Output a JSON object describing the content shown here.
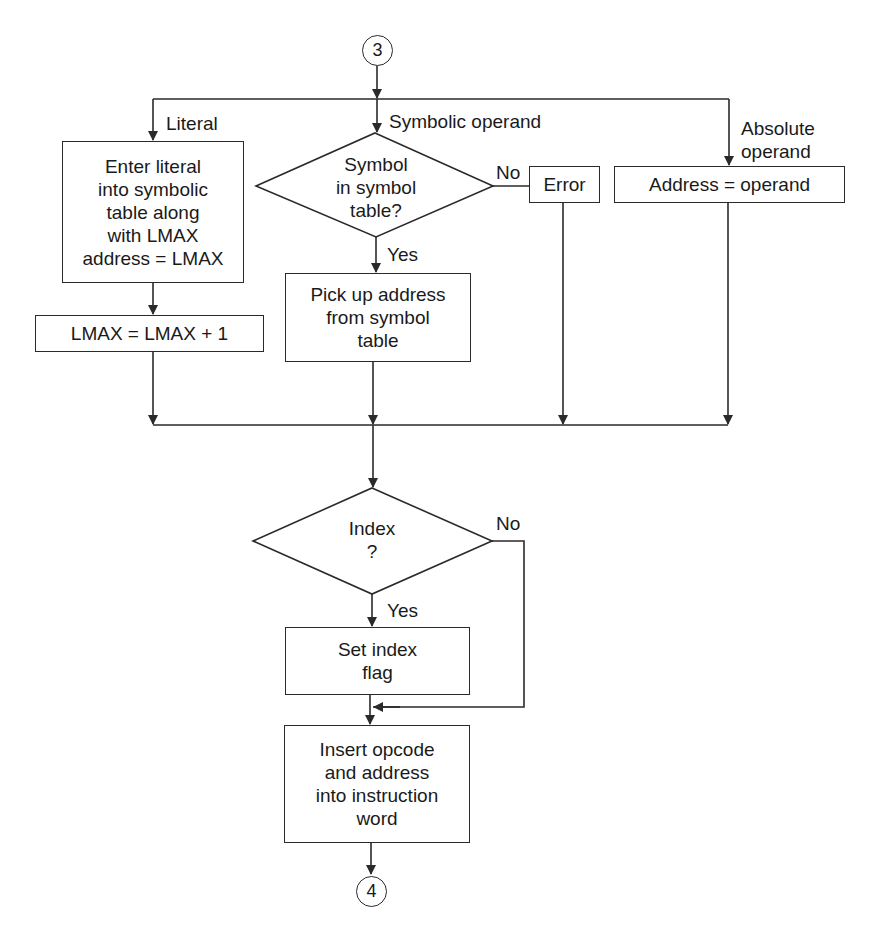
{
  "diagram": {
    "type": "flowchart",
    "connectors": {
      "entry": "3",
      "exit": "4"
    },
    "branch_labels": {
      "literal": "Literal",
      "symbolic": "Symbolic operand",
      "absolute": "Absolute\noperand"
    },
    "nodes": {
      "enter_literal": "Enter literal\ninto symbolic\ntable along\nwith LMAX\naddress = LMAX",
      "lmax_increment": "LMAX = LMAX + 1",
      "symbol_decision": "Symbol\nin symbol\ntable?",
      "error": "Error",
      "address_operand": "Address = operand",
      "pickup_address": "Pick up address\nfrom symbol\ntable",
      "index_decision": "Index\n?",
      "set_index_flag": "Set index\nflag",
      "insert_opcode": "Insert opcode\nand address\ninto instruction\nword"
    },
    "edge_labels": {
      "symbol_no": "No",
      "symbol_yes": "Yes",
      "index_no": "No",
      "index_yes": "Yes"
    },
    "colors": {
      "line": "#2a2a2a",
      "background": "#ffffff",
      "text": "#1a1a1a"
    }
  }
}
